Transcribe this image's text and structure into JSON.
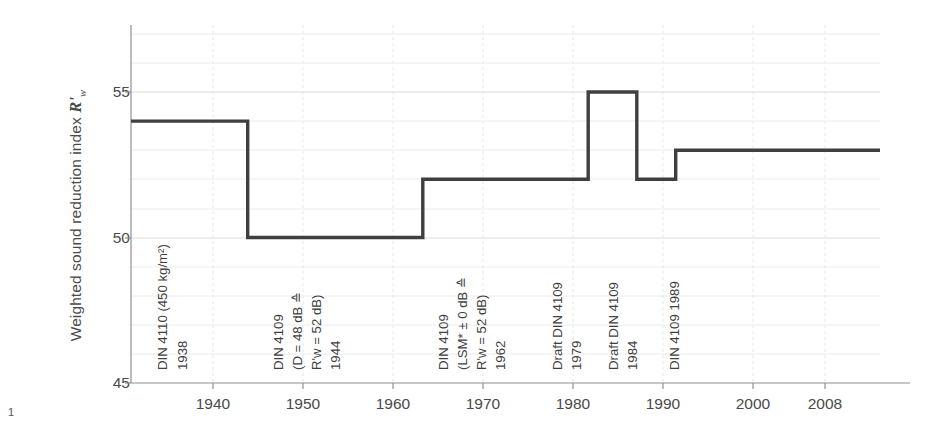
{
  "footnote": "1",
  "axes": {
    "y_title_prefix": "Weighted sound reduction index",
    "y_title_symbol": "R'",
    "y_title_subscript": "w",
    "y_ticks": [
      "45",
      "50",
      "55"
    ],
    "x_ticks": [
      "1940",
      "1950",
      "1960",
      "1970",
      "1980",
      "1990",
      "2000",
      "2008"
    ]
  },
  "annotations": [
    {
      "id": "din-4110-1938",
      "lines": [
        "DIN 4110 (450 kg/m²)"
      ],
      "year": "1938"
    },
    {
      "id": "din-4109-1944",
      "lines": [
        "DIN 4109",
        "(D = 48 dB ≙",
        "R'w = 52 dB)"
      ],
      "year": "1944"
    },
    {
      "id": "din-4109-1962",
      "lines": [
        "DIN 4109",
        "(LSM* ± 0 dB ≙",
        "R'w = 52 dB)"
      ],
      "year": "1962"
    },
    {
      "id": "draft-din-4109-1979",
      "lines": [
        "Draft DIN 4109"
      ],
      "year": "1979"
    },
    {
      "id": "draft-din-4109-1984",
      "lines": [
        "Draft DIN 4109"
      ],
      "year": "1984"
    },
    {
      "id": "din-4109-1989",
      "lines": [
        "DIN 4109 1989"
      ],
      "year": ""
    }
  ],
  "chart_data": {
    "type": "line",
    "title": "",
    "xlabel": "",
    "ylabel": "Weighted sound reduction index R'w",
    "xlim": [
      1932,
      2009
    ],
    "ylim": [
      45,
      57
    ],
    "grid": true,
    "legend": null,
    "step_style": "post",
    "x": [
      1932,
      1944,
      1962,
      1979,
      1984,
      1988,
      2009
    ],
    "values": [
      54,
      50,
      52,
      55,
      52,
      53,
      53
    ],
    "segments": [
      {
        "from": 1932,
        "to": 1944,
        "value": 54,
        "standard": "DIN 4110 (450 kg/m²) 1938"
      },
      {
        "from": 1944,
        "to": 1962,
        "value": 50,
        "standard": "DIN 4109 1944"
      },
      {
        "from": 1962,
        "to": 1979,
        "value": 52,
        "standard": "DIN 4109 1962"
      },
      {
        "from": 1979,
        "to": 1984,
        "value": 55,
        "standard": "Draft DIN 4109 1979"
      },
      {
        "from": 1984,
        "to": 1988,
        "value": 52,
        "standard": "Draft DIN 4109 1984"
      },
      {
        "from": 1988,
        "to": 2009,
        "value": 53,
        "standard": "DIN 4109 1989"
      }
    ],
    "yticks": [
      45,
      50,
      55
    ],
    "xticks": [
      1940,
      1950,
      1960,
      1970,
      1980,
      1990,
      2000,
      2008
    ]
  },
  "colors": {
    "line": "#3f3f3f",
    "axis": "#8a8a8a",
    "grid": "#e2e2e2",
    "text": "#4a4a4a"
  }
}
